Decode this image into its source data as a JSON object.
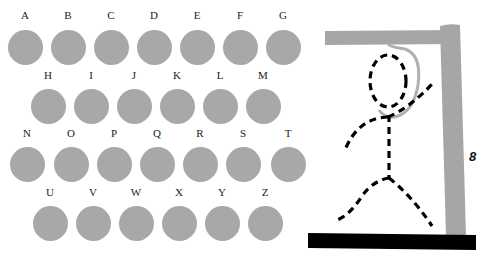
{
  "colors": {
    "button": "#a8a8a8",
    "gallows": "#a6a6a6",
    "rope": "#b0b0b0",
    "base": "#000000",
    "figure": "#000000"
  },
  "letters": [
    {
      "letter": "A",
      "x": 25,
      "ly": 15,
      "cy": 47
    },
    {
      "letter": "B",
      "x": 68,
      "ly": 15,
      "cy": 47
    },
    {
      "letter": "C",
      "x": 111,
      "ly": 15,
      "cy": 47
    },
    {
      "letter": "D",
      "x": 154,
      "ly": 15,
      "cy": 47
    },
    {
      "letter": "E",
      "x": 197,
      "ly": 15,
      "cy": 47
    },
    {
      "letter": "F",
      "x": 240,
      "ly": 15,
      "cy": 47
    },
    {
      "letter": "G",
      "x": 283,
      "ly": 15,
      "cy": 47
    },
    {
      "letter": "H",
      "x": 48,
      "ly": 75,
      "cy": 106
    },
    {
      "letter": "I",
      "x": 91,
      "ly": 75,
      "cy": 106
    },
    {
      "letter": "J",
      "x": 134,
      "ly": 75,
      "cy": 106
    },
    {
      "letter": "K",
      "x": 177,
      "ly": 75,
      "cy": 106
    },
    {
      "letter": "L",
      "x": 220,
      "ly": 75,
      "cy": 106
    },
    {
      "letter": "M",
      "x": 263,
      "ly": 75,
      "cy": 106
    },
    {
      "letter": "N",
      "x": 27,
      "ly": 133,
      "cy": 164
    },
    {
      "letter": "O",
      "x": 71,
      "ly": 133,
      "cy": 164
    },
    {
      "letter": "P",
      "x": 114,
      "ly": 133,
      "cy": 164
    },
    {
      "letter": "Q",
      "x": 157,
      "ly": 133,
      "cy": 164
    },
    {
      "letter": "R",
      "x": 200,
      "ly": 133,
      "cy": 164
    },
    {
      "letter": "S",
      "x": 243,
      "ly": 133,
      "cy": 164
    },
    {
      "letter": "T",
      "x": 288,
      "ly": 133,
      "cy": 164
    },
    {
      "letter": "U",
      "x": 50,
      "ly": 192,
      "cy": 223
    },
    {
      "letter": "V",
      "x": 93,
      "ly": 192,
      "cy": 223
    },
    {
      "letter": "W",
      "x": 136,
      "ly": 192,
      "cy": 223
    },
    {
      "letter": "X",
      "x": 179,
      "ly": 192,
      "cy": 223
    },
    {
      "letter": "Y",
      "x": 222,
      "ly": 192,
      "cy": 223
    },
    {
      "letter": "Z",
      "x": 265,
      "ly": 192,
      "cy": 223
    }
  ],
  "game": {
    "wrong_guesses_remaining": "8"
  }
}
